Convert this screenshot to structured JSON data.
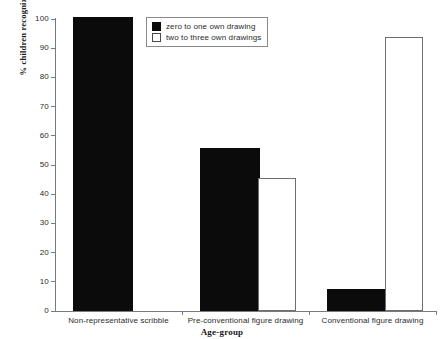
{
  "chart_data": {
    "type": "bar",
    "title": "",
    "xlabel": "Age-group",
    "ylabel": "% children recognizing",
    "ylim": [
      0,
      100
    ],
    "yticks": [
      0,
      10,
      20,
      30,
      40,
      50,
      60,
      70,
      80,
      90,
      100
    ],
    "grid": false,
    "legend_position": "top-center",
    "categories": [
      "Non-representative scribble",
      "Pre-conventional figure drawing",
      "Conventional figure drawing"
    ],
    "series": [
      {
        "name": "zero to one own drawing",
        "color": "#0b0b0b",
        "fill": "solid",
        "values": [
          100,
          55,
          7
        ]
      },
      {
        "name": "two to three own drawings",
        "color": "#ffffff",
        "fill": "open",
        "values": [
          0,
          45,
          93
        ]
      }
    ]
  },
  "legend": {
    "items": [
      {
        "label": "zero to one own drawing",
        "swatch": "filled-black-square"
      },
      {
        "label": "two to three own drawings",
        "swatch": "open-white-square"
      }
    ]
  },
  "axes": {
    "y_title": "% children recognizing",
    "x_title": "Age-group",
    "y_tick_labels": [
      "100",
      "90",
      "80",
      "70",
      "60",
      "50",
      "40",
      "30",
      "20",
      "10",
      "0"
    ]
  }
}
